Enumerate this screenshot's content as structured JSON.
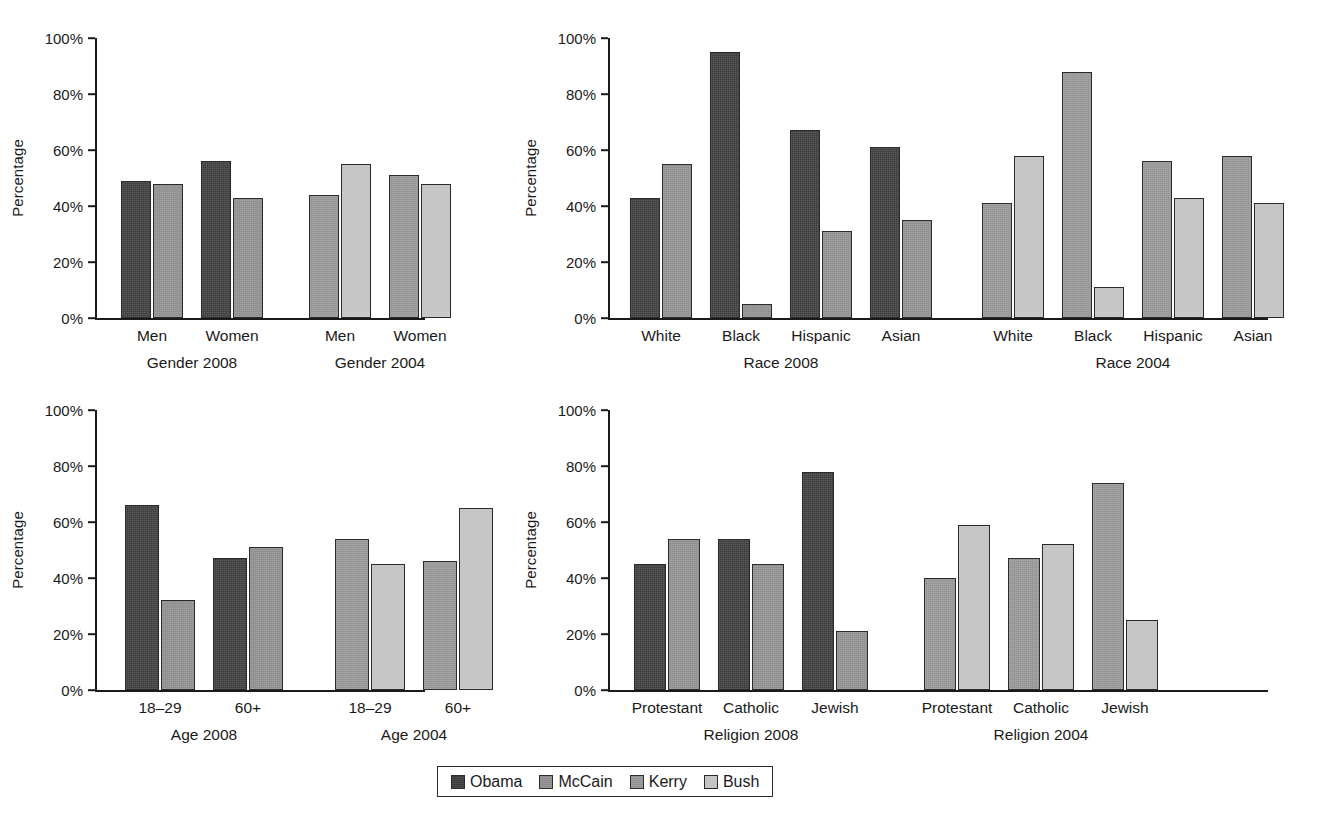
{
  "chart_data": [
    {
      "type": "bar",
      "title": "Gender 2008 / Gender 2004",
      "xlabel": "",
      "ylabel": "Percentage",
      "ylim": [
        0,
        100
      ],
      "yticks": [
        "0%",
        "20%",
        "40%",
        "60%",
        "80%",
        "100%"
      ],
      "grid": false,
      "groups": [
        {
          "group_label": "Gender 2008",
          "categories": [
            "Men",
            "Women"
          ],
          "series": [
            {
              "name": "Obama",
              "values": [
                49,
                56
              ]
            },
            {
              "name": "McCain",
              "values": [
                48,
                43
              ]
            }
          ]
        },
        {
          "group_label": "Gender 2004",
          "categories": [
            "Men",
            "Women"
          ],
          "series": [
            {
              "name": "Kerry",
              "values": [
                44,
                51
              ]
            },
            {
              "name": "Bush",
              "values": [
                55,
                48
              ]
            }
          ]
        }
      ]
    },
    {
      "type": "bar",
      "title": "Race 2008 / Race 2004",
      "xlabel": "",
      "ylabel": "Percentage",
      "ylim": [
        0,
        100
      ],
      "yticks": [
        "0%",
        "20%",
        "40%",
        "60%",
        "80%",
        "100%"
      ],
      "grid": false,
      "groups": [
        {
          "group_label": "Race 2008",
          "categories": [
            "White",
            "Black",
            "Hispanic",
            "Asian"
          ],
          "series": [
            {
              "name": "Obama",
              "values": [
                43,
                95,
                67,
                61
              ]
            },
            {
              "name": "McCain",
              "values": [
                55,
                5,
                31,
                35
              ]
            }
          ]
        },
        {
          "group_label": "Race 2004",
          "categories": [
            "White",
            "Black",
            "Hispanic",
            "Asian"
          ],
          "series": [
            {
              "name": "Kerry",
              "values": [
                41,
                88,
                56,
                58
              ]
            },
            {
              "name": "Bush",
              "values": [
                58,
                11,
                43,
                41
              ]
            }
          ]
        }
      ]
    },
    {
      "type": "bar",
      "title": "Age 2008 / Age 2004",
      "xlabel": "",
      "ylabel": "Percentage",
      "ylim": [
        0,
        100
      ],
      "yticks": [
        "0%",
        "20%",
        "40%",
        "60%",
        "80%",
        "100%"
      ],
      "grid": false,
      "groups": [
        {
          "group_label": "Age 2008",
          "categories": [
            "18–29",
            "60+"
          ],
          "series": [
            {
              "name": "Obama",
              "values": [
                66,
                47
              ]
            },
            {
              "name": "McCain",
              "values": [
                32,
                51
              ]
            }
          ]
        },
        {
          "group_label": "Age 2004",
          "categories": [
            "18–29",
            "60+"
          ],
          "series": [
            {
              "name": "Kerry",
              "values": [
                54,
                46
              ]
            },
            {
              "name": "Bush",
              "values": [
                45,
                65
              ]
            }
          ]
        }
      ]
    },
    {
      "type": "bar",
      "title": "Religion 2008 / Religion 2004",
      "xlabel": "",
      "ylabel": "Percentage",
      "ylim": [
        0,
        100
      ],
      "yticks": [
        "0%",
        "20%",
        "40%",
        "60%",
        "80%",
        "100%"
      ],
      "grid": false,
      "groups": [
        {
          "group_label": "Religion 2008",
          "categories": [
            "Protestant",
            "Catholic",
            "Jewish"
          ],
          "series": [
            {
              "name": "Obama",
              "values": [
                45,
                54,
                78
              ]
            },
            {
              "name": "McCain",
              "values": [
                54,
                45,
                21
              ]
            }
          ]
        },
        {
          "group_label": "Religion 2004",
          "categories": [
            "Protestant",
            "Catholic",
            "Jewish"
          ],
          "series": [
            {
              "name": "Kerry",
              "values": [
                40,
                47,
                74
              ]
            },
            {
              "name": "Bush",
              "values": [
                59,
                52,
                25
              ]
            }
          ]
        }
      ]
    }
  ],
  "legend": {
    "position": "bottom-center",
    "entries": [
      {
        "label": "Obama",
        "color": "#3b3b3b"
      },
      {
        "label": "McCain",
        "color": "#8d8d8d"
      },
      {
        "label": "Kerry",
        "color": "#949494"
      },
      {
        "label": "Bush",
        "color": "#c2c2c2"
      }
    ]
  }
}
